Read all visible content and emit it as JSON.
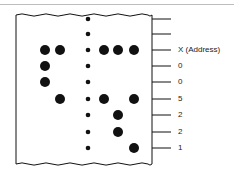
{
  "diagram": {
    "type": "punched-paper-tape",
    "tape": {
      "left": 16,
      "right": 152,
      "top": 15,
      "bottom": 164
    },
    "columns_x": [
      45,
      60,
      88,
      104,
      118,
      134
    ],
    "sprocket_column_index": 2,
    "rows": [
      {
        "y": 19,
        "holes": [],
        "label": ""
      },
      {
        "y": 34,
        "holes": [],
        "label": ""
      },
      {
        "y": 50,
        "holes": [
          0,
          1,
          3,
          4,
          5
        ],
        "label": "X (Address)"
      },
      {
        "y": 66,
        "holes": [
          0
        ],
        "label": "0"
      },
      {
        "y": 82,
        "holes": [
          0
        ],
        "label": "0"
      },
      {
        "y": 99,
        "holes": [
          1,
          3,
          5
        ],
        "label": "5"
      },
      {
        "y": 115,
        "holes": [
          4
        ],
        "label": "2"
      },
      {
        "y": 132,
        "holes": [
          4
        ],
        "label": "2"
      },
      {
        "y": 148,
        "holes": [
          5
        ],
        "label": "1"
      }
    ],
    "colors": {
      "ink": "#111111",
      "tape_fill": "#ffffff",
      "rule": "#bdbdbd"
    }
  }
}
